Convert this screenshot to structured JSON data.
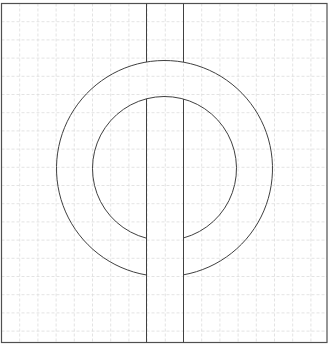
{
  "diagram": {
    "type": "geometric-figure",
    "colors": {
      "background": "#ffffff",
      "grid": "#dcdcdc",
      "stroke": "#404040",
      "frame": "#505050"
    },
    "frame": {
      "x": 1.5,
      "y": 3.5,
      "width": 325.5,
      "height": 339
    },
    "grid": {
      "origin_x": 1.5,
      "origin_y": 3.5,
      "spacing": 18.2,
      "dashed": true
    },
    "ring": {
      "center_x": 164.5,
      "center_y": 168.5,
      "outer_radius": 108,
      "inner_radius": 72
    },
    "band": {
      "left_x": 146.5,
      "right_x": 183.5,
      "top_y": 3.5,
      "bottom_y": 342.5
    }
  }
}
